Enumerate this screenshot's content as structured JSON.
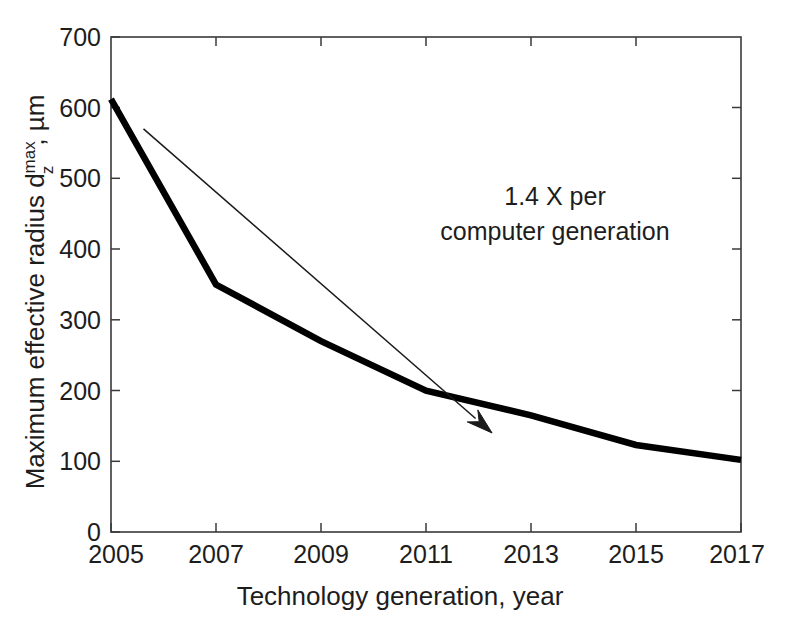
{
  "chart_data": {
    "type": "line",
    "title": "",
    "xlabel": "Technology generation, year",
    "ylabel_parts": {
      "main": "Maximum effective radius d",
      "sub": "z",
      "sup": "max",
      "tail": ", µm"
    },
    "ylabel": "Maximum effective radius d_z^max , µm",
    "x": [
      2005,
      2007,
      2009,
      2011,
      2013,
      2015,
      2017
    ],
    "values": [
      612,
      350,
      270,
      200,
      165,
      123,
      102
    ],
    "series": [
      {
        "name": "Maximum effective radius",
        "values": [
          612,
          350,
          270,
          200,
          165,
          123,
          102
        ],
        "color": "#000000"
      }
    ],
    "xlim": [
      2005,
      2017
    ],
    "ylim": [
      0,
      700
    ],
    "yticks": [
      0,
      100,
      200,
      300,
      400,
      500,
      600,
      700
    ],
    "ytick_labels": [
      "0",
      "100",
      "200",
      "300",
      "400",
      "500",
      "600",
      "700"
    ],
    "xticks": [
      2005,
      2006,
      2007,
      2008,
      2009,
      2010,
      2011,
      2012,
      2013,
      2014,
      2015,
      2016,
      2017
    ],
    "xtick_labels": [
      "2005",
      "2007",
      "2009",
      "2011",
      "2013",
      "2015",
      "2017"
    ],
    "xtick_labeled_values": [
      2005,
      2007,
      2009,
      2011,
      2013,
      2015,
      2017
    ],
    "grid": false,
    "legend": "none",
    "annotations": [
      {
        "id": "trend-annotation",
        "line1": "1.4 X per",
        "line2": "computer generation",
        "text": "1.4 X per computer generation",
        "arrow": {
          "from": [
            2005.62,
            570
          ],
          "to": [
            2012.26,
            140
          ]
        }
      }
    ],
    "colors": {
      "data_line": "#000000",
      "axis": "#3a3a3a",
      "text": "#1d1d1d",
      "background": "#ffffff",
      "annotation": "#1a1a1a"
    }
  }
}
